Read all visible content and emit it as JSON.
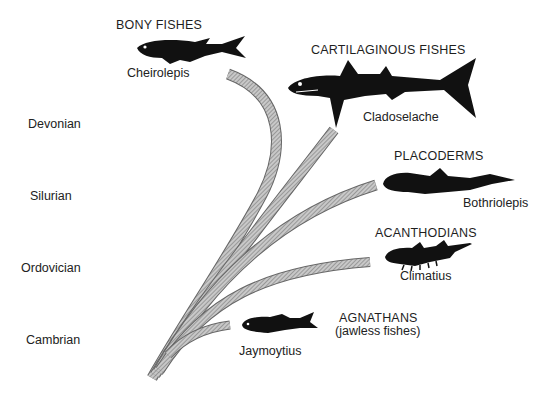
{
  "diagram": {
    "type": "phylogenetic-tree"
  },
  "periods": [
    {
      "label": "Devonian"
    },
    {
      "label": "Silurian"
    },
    {
      "label": "Ordovician"
    },
    {
      "label": "Cambrian"
    }
  ],
  "groups": {
    "bony": {
      "name": "BONY FISHES",
      "genus": "Cheirolepis"
    },
    "cartilaginous": {
      "name": "CARTILAGINOUS FISHES",
      "genus": "Cladoselache"
    },
    "placoderms": {
      "name": "PLACODERMS",
      "genus": "Bothriolepis"
    },
    "acanthodians": {
      "name": "ACANTHODIANS",
      "genus": "Climatius"
    },
    "agnathans": {
      "name": "AGNATHANS",
      "subtitle": "(jawless fishes)",
      "genus": "Jaymoytius"
    }
  },
  "colors": {
    "branch_fill": "#b8b8b8",
    "branch_hatch": "#8a8a8a",
    "fish": "#111111",
    "text": "#1e1e1e"
  }
}
